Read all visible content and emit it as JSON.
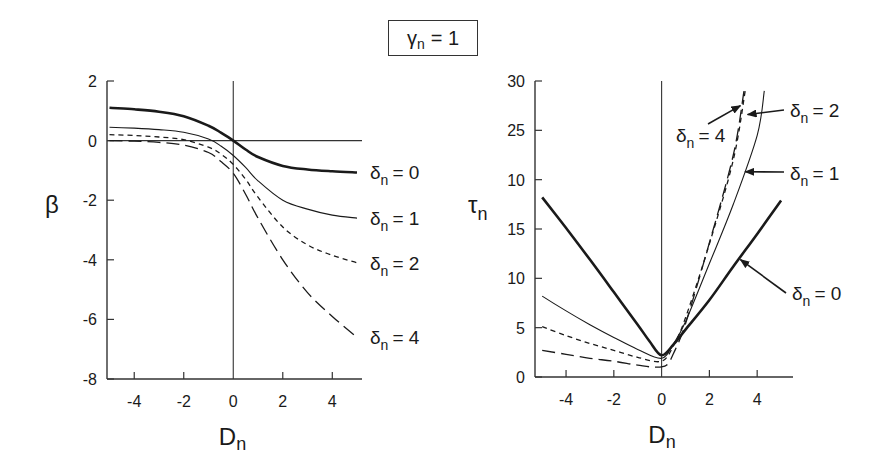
{
  "figure": {
    "title_symbol": "γ",
    "title_sub": "n",
    "title_value": "= 1"
  },
  "chart_data": [
    {
      "type": "line",
      "title": "γn = 1",
      "xlabel": "Dn",
      "ylabel": "β",
      "xlim": [
        -5.1,
        5.2
      ],
      "ylim": [
        -8,
        2
      ],
      "xticks": [
        -4,
        -2,
        0,
        2,
        4
      ],
      "xtick_labels": [
        "-4",
        "-2",
        "0",
        "2",
        "4"
      ],
      "yticks": [
        2,
        0,
        -2,
        -4,
        -6,
        -8
      ],
      "ytick_labels": [
        "2",
        "0",
        "-2",
        "-4",
        "-6",
        "-8"
      ],
      "grid": false,
      "reference_lines": {
        "horizontal": 0,
        "vertical": 0
      },
      "x": [
        -5,
        -4,
        -3,
        -2,
        -1,
        -0.5,
        0,
        0.5,
        1,
        2,
        3,
        4,
        5
      ],
      "series": [
        {
          "name": "δn = 0",
          "style": "thick-solid",
          "values": [
            1.1,
            1.05,
            0.97,
            0.82,
            0.5,
            0.27,
            0.0,
            -0.3,
            -0.55,
            -0.85,
            -0.97,
            -1.03,
            -1.07
          ]
        },
        {
          "name": "δn = 1",
          "style": "thin-solid",
          "values": [
            0.45,
            0.42,
            0.37,
            0.28,
            0.05,
            -0.18,
            -0.5,
            -0.9,
            -1.35,
            -2.0,
            -2.3,
            -2.5,
            -2.6
          ]
        },
        {
          "name": "δn = 2",
          "style": "short-dash",
          "values": [
            0.2,
            0.17,
            0.12,
            0.03,
            -0.22,
            -0.45,
            -0.8,
            -1.3,
            -1.9,
            -2.9,
            -3.5,
            -3.85,
            -4.1
          ]
        },
        {
          "name": "δn = 4",
          "style": "long-dash",
          "values": [
            0.0,
            -0.02,
            -0.06,
            -0.15,
            -0.4,
            -0.7,
            -1.1,
            -1.8,
            -2.6,
            -4.0,
            -5.1,
            -5.9,
            -6.6
          ]
        }
      ],
      "annotations": [
        {
          "text": "δn = 0",
          "at_series": "δn = 0"
        },
        {
          "text": "δn = 1",
          "at_series": "δn = 1"
        },
        {
          "text": "δn = 2",
          "at_series": "δn = 2"
        },
        {
          "text": "δn = 4",
          "at_series": "δn = 4"
        }
      ]
    },
    {
      "type": "line",
      "title": "γn = 1",
      "xlabel": "Dn",
      "ylabel": "τn",
      "xlim": [
        -5.3,
        5.5
      ],
      "ylim": [
        0,
        30
      ],
      "xticks": [
        -4,
        -2,
        0,
        2,
        4
      ],
      "xtick_labels": [
        "-4",
        "-2",
        "0",
        "2",
        "4"
      ],
      "yticks": [
        0,
        5,
        10,
        15,
        20,
        25,
        30
      ],
      "ytick_labels": [
        "0",
        "5",
        "10",
        "15",
        "10",
        "25",
        "30"
      ],
      "grid": false,
      "reference_lines": {
        "vertical": 0
      },
      "series": [
        {
          "name": "δn = 0",
          "style": "thick-solid",
          "x": [
            -5,
            -4,
            -3,
            -2,
            -1,
            -0.5,
            0,
            0.5,
            1,
            2,
            3,
            4,
            5
          ],
          "values": [
            18.2,
            15.1,
            11.9,
            8.6,
            5.3,
            3.6,
            2.2,
            3.3,
            4.8,
            7.8,
            11.2,
            14.5,
            17.9
          ]
        },
        {
          "name": "δn = 1",
          "style": "thin-solid",
          "x": [
            -5,
            -4,
            -3,
            -2,
            -1,
            0,
            0.5,
            1,
            2,
            3,
            4,
            4.3
          ],
          "values": [
            8.2,
            6.7,
            5.3,
            4.0,
            2.8,
            1.9,
            3.4,
            5.6,
            11.5,
            17.5,
            24.5,
            29.0
          ]
        },
        {
          "name": "δn = 2",
          "style": "short-dash",
          "x": [
            -5,
            -4,
            -3,
            -2,
            -1,
            0,
            0.5,
            1,
            2,
            3,
            3.5
          ],
          "values": [
            5.1,
            4.2,
            3.4,
            2.7,
            2.0,
            1.6,
            3.2,
            6.0,
            13.5,
            22.0,
            29.0
          ]
        },
        {
          "name": "δn = 4",
          "style": "long-dash",
          "x": [
            -5,
            -4,
            -3,
            -2,
            -1,
            -0.3,
            0.2,
            0.5,
            1,
            2,
            3,
            3.45
          ],
          "values": [
            2.7,
            2.3,
            1.9,
            1.6,
            1.2,
            1.0,
            1.2,
            2.4,
            5.4,
            13.6,
            22.5,
            29.0
          ]
        }
      ],
      "annotations": [
        {
          "text": "δn = 4",
          "arrow_to": [
            3.3,
            27.5
          ]
        },
        {
          "text": "δn = 2",
          "arrow_to": [
            3.6,
            26.6
          ]
        },
        {
          "text": "δn = 1",
          "arrow_to": [
            3.5,
            20.8
          ]
        },
        {
          "text": "δn = 0",
          "arrow_to": [
            3.3,
            11.9
          ]
        }
      ]
    }
  ]
}
